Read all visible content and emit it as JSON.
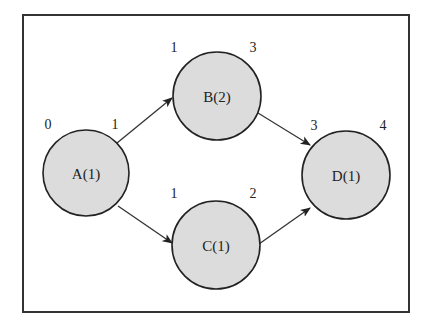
{
  "diagram": {
    "type": "activity-network",
    "colors": {
      "node_fill": "#dcdcdc",
      "stroke": "#222222",
      "background": "#ffffff"
    },
    "nodes": [
      {
        "id": "A",
        "label": "A(1)",
        "start_label": "0",
        "end_label": "1"
      },
      {
        "id": "B",
        "label": "B(2)",
        "start_label": "1",
        "end_label": "3"
      },
      {
        "id": "C",
        "label": "C(1)",
        "start_label": "1",
        "end_label": "2"
      },
      {
        "id": "D",
        "label": "D(1)",
        "start_label": "3",
        "end_label": "4"
      }
    ],
    "edges": [
      {
        "from": "A",
        "to": "B"
      },
      {
        "from": "A",
        "to": "C"
      },
      {
        "from": "B",
        "to": "D"
      },
      {
        "from": "C",
        "to": "D"
      }
    ]
  }
}
